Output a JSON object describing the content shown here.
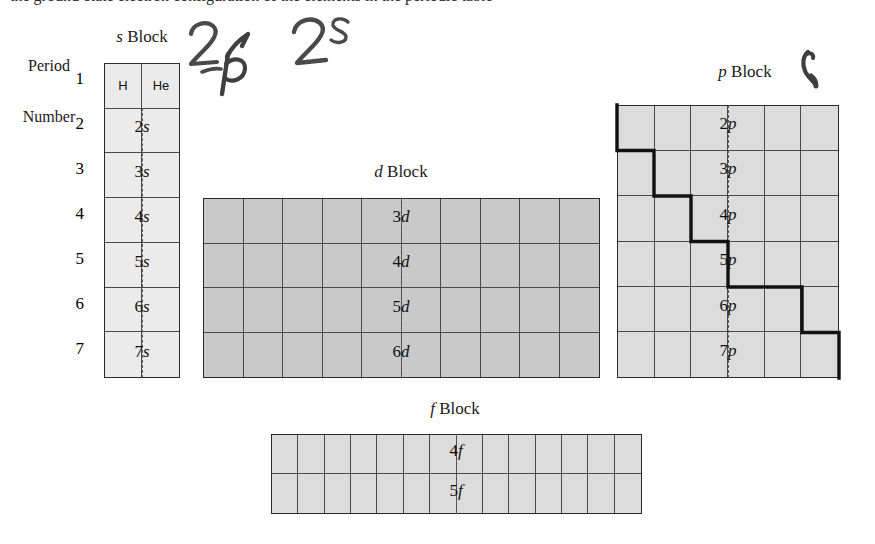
{
  "page": {
    "width": 875,
    "height": 544,
    "background": "#ffffff",
    "cropped_top_line": "the ground-state electron configuration of the elements in the periodic table"
  },
  "axis": {
    "period_label_line1": "Period",
    "period_label_line2": "Number",
    "period_numbers": [
      "1",
      "2",
      "3",
      "4",
      "5",
      "6",
      "7"
    ]
  },
  "blocks": {
    "s": {
      "title_italic": "s",
      "title_rest": " Block",
      "columns": 2,
      "rows": 7,
      "fill": "#ebebeb",
      "elements": [
        "H",
        "He"
      ],
      "orbitals": [
        "2s",
        "3s",
        "4s",
        "5s",
        "6s",
        "7s"
      ],
      "orbital_numbers": [
        "2",
        "3",
        "4",
        "5",
        "6",
        "7"
      ],
      "orbital_letter": "s"
    },
    "d": {
      "title_italic": "d",
      "title_rest": " Block",
      "columns": 10,
      "rows": 4,
      "fill": "#c9c9c9",
      "orbitals": [
        "3d",
        "4d",
        "5d",
        "6d"
      ],
      "orbital_numbers": [
        "3",
        "4",
        "5",
        "6"
      ],
      "orbital_letter": "d"
    },
    "p": {
      "title_italic": "p",
      "title_rest": " Block",
      "columns": 6,
      "rows": 6,
      "fill": "#dcdcdc",
      "orbitals": [
        "2p",
        "3p",
        "4p",
        "5p",
        "6p",
        "7p"
      ],
      "orbital_numbers": [
        "2",
        "3",
        "4",
        "5",
        "6",
        "7"
      ],
      "orbital_letter": "p",
      "staircase_note": "bold metal/nonmetal dividing line"
    },
    "f": {
      "title_italic": "f",
      "title_rest": " Block",
      "columns": 14,
      "rows": 2,
      "fill": "#dcdcdc",
      "orbitals": [
        "4f",
        "5f"
      ],
      "orbital_numbers": [
        "4",
        "5"
      ],
      "orbital_letter": "f"
    }
  },
  "annotations": {
    "handwritten": [
      {
        "text": "2",
        "note": "pencil digit above s-block header"
      },
      {
        "text": "p",
        "note": "pencil letter p with leading dash"
      },
      {
        "text": "2s",
        "note": "pencil 2 with superscript s"
      },
      {
        "text": "check",
        "note": "pencil tick mark right of p Block title"
      }
    ]
  }
}
